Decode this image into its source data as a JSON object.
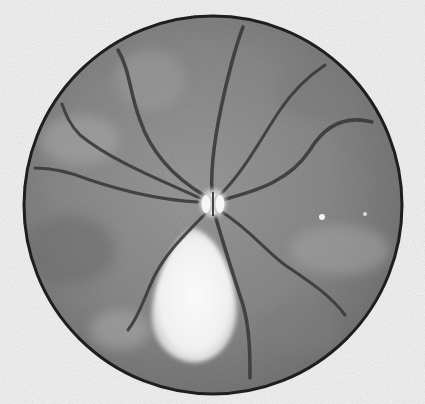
{
  "image": {
    "subject": "Grayscale retinal fundus photograph",
    "description": "Circular fundus view with optic disc near center, radiating blood vessels, and a large bright pale lesion below the optic disc.",
    "colors": {
      "background": "#f2f2f2",
      "fundus_base": "#8a8a8a",
      "fundus_dark": "#6e6e6e",
      "fundus_light": "#a5a5a5",
      "rim": "#1e1e1e",
      "vessel": "#3a3a3a",
      "optic_disc": "#f4f4f4",
      "lesion": "#f7f7f7"
    },
    "geometry": {
      "fundus_center": [
        213,
        205
      ],
      "fundus_radius": 190,
      "optic_disc_center": [
        213,
        203
      ],
      "lesion_center": [
        188,
        298
      ]
    }
  }
}
